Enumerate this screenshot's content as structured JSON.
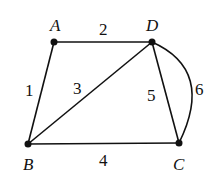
{
  "graph": {
    "nodes": [
      {
        "id": "A",
        "label": "A",
        "x": 54,
        "y": 42
      },
      {
        "id": "D",
        "label": "D",
        "x": 152,
        "y": 42
      },
      {
        "id": "B",
        "label": "B",
        "x": 28,
        "y": 144
      },
      {
        "id": "C",
        "label": "C",
        "x": 179,
        "y": 143
      }
    ],
    "edges": [
      {
        "id": "e1",
        "from": "A",
        "to": "B",
        "label": "1"
      },
      {
        "id": "e2",
        "from": "A",
        "to": "D",
        "label": "2"
      },
      {
        "id": "e3",
        "from": "B",
        "to": "D",
        "label": "3"
      },
      {
        "id": "e4",
        "from": "B",
        "to": "C",
        "label": "4"
      },
      {
        "id": "e5",
        "from": "D",
        "to": "C",
        "label": "5"
      },
      {
        "id": "e6",
        "from": "D",
        "to": "C",
        "label": "6",
        "curved": true
      }
    ]
  },
  "colors": {
    "stroke": "#111111",
    "background": "#ffffff"
  }
}
